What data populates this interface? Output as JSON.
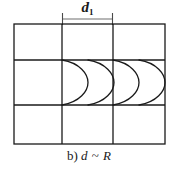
{
  "figure": {
    "caption_prefix": "b)",
    "caption_symbol_left": "d",
    "caption_relation": "~",
    "caption_symbol_right": "R",
    "caption_full": "b) d ~ R",
    "dimension_label": "d",
    "dimension_label_subscript": "1",
    "line_color": "#1a1a1a",
    "background_color": "#ffffff",
    "grid": {
      "columns": 3,
      "rows": 3,
      "left": 14,
      "top": 24,
      "right": 165,
      "bottom": 144,
      "column_edges": [
        14,
        62,
        113,
        165
      ],
      "row_edges": [
        24,
        60,
        105,
        144
      ],
      "stroke_width": 1.3
    },
    "dimension_line": {
      "y": 19,
      "x_start": 62,
      "x_end": 113,
      "tick_half_height": 5,
      "measured_span": "d",
      "spans_column_index": 1
    },
    "arcs": {
      "count": 4,
      "shape": "semicircle-bulging-right",
      "row_index": 1,
      "top_y": 60,
      "bottom_y": 105,
      "base_x": [
        62,
        88,
        113,
        139
      ],
      "bulge_radius": 26,
      "stroke_width": 1.3
    }
  }
}
